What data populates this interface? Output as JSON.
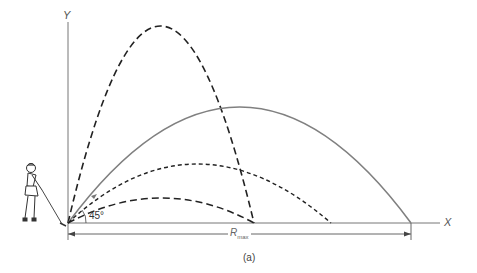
{
  "figure": {
    "y_axis_label": "Y",
    "x_axis_label": "X",
    "angle_label": "45°",
    "range_label_main": "R",
    "range_label_sub": "max",
    "caption": "(a)",
    "colors": {
      "axes": "#666666",
      "solid_trajectory": "#777777",
      "dashed_trajectories": "#222222"
    },
    "trajectories": [
      {
        "name": "steep-high-angle",
        "style": "long-dash",
        "peak": [
          160,
          26
        ],
        "landing": [
          254,
          223
        ]
      },
      {
        "name": "45-degree-max-range",
        "style": "solid",
        "peak": [
          240,
          107
        ],
        "landing": [
          411,
          223
        ]
      },
      {
        "name": "medium-angle",
        "style": "short-dash",
        "peak": [
          195,
          164
        ],
        "landing": [
          331,
          223
        ]
      },
      {
        "name": "low-angle",
        "style": "long-dash",
        "peak": [
          165,
          198
        ],
        "landing": [
          254,
          223
        ]
      }
    ]
  }
}
